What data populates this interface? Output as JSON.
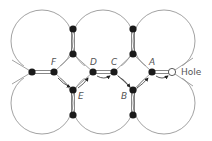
{
  "diagram": {
    "labels": {
      "F": "F",
      "D": "D",
      "C": "C",
      "A": "A",
      "E": "E",
      "B": "B",
      "hole": "Hole"
    },
    "colors": {
      "line": "#7a7a7a",
      "atom": "#1a1a1a",
      "bond": "#555555",
      "text": "#555555"
    }
  }
}
